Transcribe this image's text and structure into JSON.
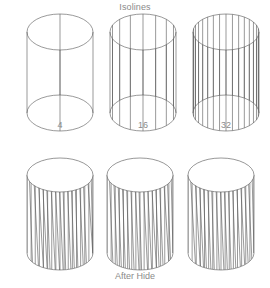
{
  "figure": {
    "title": "Isolines",
    "width": 270,
    "height": 288,
    "background": "#ffffff",
    "line_color": "#555555",
    "text_color": "#8a8a8a",
    "line_width": 0.6
  },
  "rows": [
    {
      "name": "wireframe-row",
      "caption": "Isolines",
      "caption_position": "top",
      "hidden_line_removal": false,
      "cylinders": [
        {
          "label": "4",
          "isolines": 4,
          "cx": 60,
          "top_cy": 32,
          "bottom_cy": 113,
          "rx": 33,
          "ry": 18,
          "label_x": 60,
          "label_y": 128
        },
        {
          "label": "16",
          "isolines": 16,
          "cx": 143,
          "top_cy": 32,
          "bottom_cy": 113,
          "rx": 33,
          "ry": 18,
          "label_x": 143,
          "label_y": 128
        },
        {
          "label": "32",
          "isolines": 32,
          "cx": 226,
          "top_cy": 32,
          "bottom_cy": 113,
          "rx": 33,
          "ry": 18,
          "label_x": 226,
          "label_y": 128
        }
      ]
    },
    {
      "name": "hidden-line-row",
      "caption": "After Hide",
      "caption_position": "bottom",
      "hidden_line_removal": true,
      "cylinders": [
        {
          "label": "",
          "isolines": 32,
          "cx": 60,
          "top_cy": 175,
          "bottom_cy": 253,
          "rx": 33,
          "ry": 17,
          "label_x": 60,
          "label_y": 0
        },
        {
          "label": "",
          "isolines": 32,
          "cx": 140,
          "top_cy": 175,
          "bottom_cy": 253,
          "rx": 33,
          "ry": 17,
          "label_x": 140,
          "label_y": 0
        },
        {
          "label": "",
          "isolines": 32,
          "cx": 221,
          "top_cy": 175,
          "bottom_cy": 253,
          "rx": 33,
          "ry": 17,
          "label_x": 221,
          "label_y": 0
        }
      ]
    }
  ],
  "captions": {
    "top_title": "Isolines",
    "bottom_title": "After Hide",
    "bottom_title_y": 270
  },
  "chart_data": {
    "type": "diagram",
    "title": "Isolines",
    "subtitle": "After Hide",
    "categories": [
      "4",
      "16",
      "32"
    ],
    "values": [
      4,
      16,
      32
    ],
    "xlabel": "Isolines",
    "ylabel": "",
    "series": [
      {
        "name": "Isolines",
        "values": [
          4,
          16,
          32
        ]
      },
      {
        "name": "After Hide",
        "values": [
          32,
          32,
          32
        ]
      }
    ],
    "legend": []
  }
}
